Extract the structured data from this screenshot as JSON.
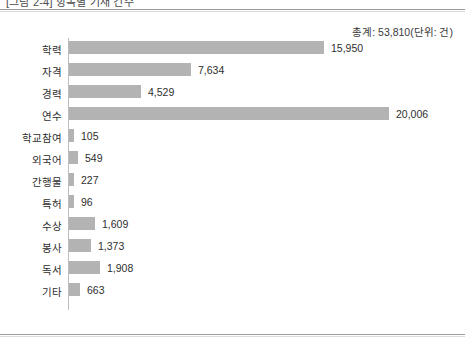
{
  "caption": {
    "text": "[그림 2-4] 항목별 기재 건수"
  },
  "chart": {
    "total_label": "총계: 53,810(단위: 건)"
  },
  "chart_data": {
    "type": "bar",
    "orientation": "horizontal",
    "title": "",
    "subtitle": "",
    "xlabel": "",
    "ylabel": "",
    "unit": "건",
    "total": 53810,
    "total_text": "총계: 53,810(단위: 건)",
    "grid": false,
    "legend": false,
    "xlim": [
      0,
      20006
    ],
    "bar_color": "#b3b3b3",
    "axis_color": "#bdbdbd",
    "categories": [
      "학력",
      "자격",
      "경력",
      "연수",
      "학교참여",
      "외국어",
      "간행물",
      "특허",
      "수상",
      "봉사",
      "독서",
      "기타"
    ],
    "values": [
      15950,
      7634,
      4529,
      20006,
      105,
      549,
      227,
      96,
      1609,
      1373,
      1908,
      663
    ],
    "value_labels": [
      "15,950",
      "7,634",
      "4,529",
      "20,006",
      "105",
      "549",
      "227",
      "96",
      "1,609",
      "1,373",
      "1,908",
      "663"
    ]
  }
}
